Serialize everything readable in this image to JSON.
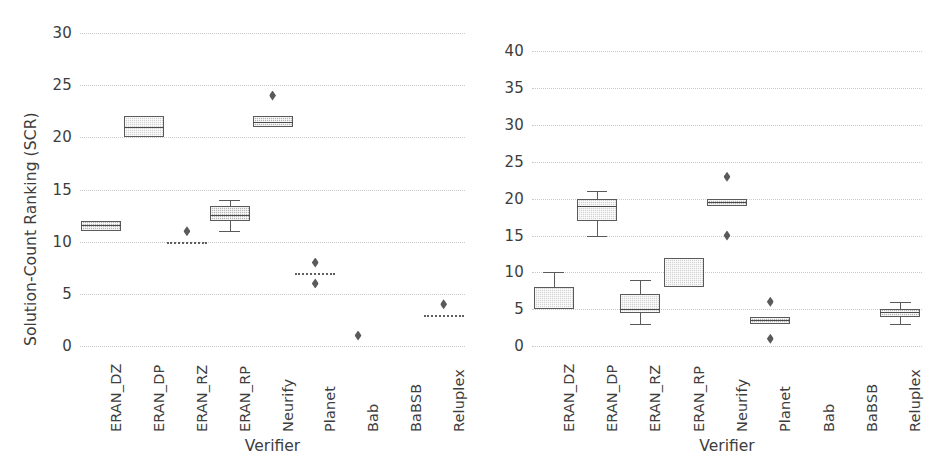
{
  "figure": {
    "width": 951,
    "height": 465,
    "background": "#ffffff",
    "panel_count": 2
  },
  "chart_data": [
    {
      "type": "box",
      "panel": "left",
      "title": "",
      "xlabel": "Verifier",
      "ylabel": "Solution-Count Ranking (SCR)",
      "ylim": [
        0,
        30
      ],
      "yticks": [
        0,
        5,
        10,
        15,
        20,
        25,
        30
      ],
      "ytick_labels": [
        "0",
        "5",
        "10",
        "15",
        "20",
        "25",
        "30"
      ],
      "grid": "horizontal-dotted",
      "legend": "none",
      "categories": [
        "ERAN_DZ",
        "ERAN_DP",
        "ERAN_RZ",
        "ERAN_RP",
        "Neurify",
        "Planet",
        "Bab",
        "BaBSB",
        "Reluplex"
      ],
      "boxes": [
        {
          "category": "ERAN_DZ",
          "whisker_low": 11,
          "q1": 11,
          "median": 11.6,
          "q3": 12,
          "whisker_high": 12,
          "fliers": [],
          "degenerate": false
        },
        {
          "category": "ERAN_DP",
          "whisker_low": 20,
          "q1": 20,
          "median": 21,
          "q3": 22,
          "whisker_high": 22,
          "fliers": [],
          "degenerate": false
        },
        {
          "category": "ERAN_RZ",
          "whisker_low": 10,
          "q1": 10,
          "median": 10,
          "q3": 10,
          "whisker_high": 10,
          "fliers": [
            11
          ],
          "degenerate": true
        },
        {
          "category": "ERAN_RP",
          "whisker_low": 11,
          "q1": 12,
          "median": 12.6,
          "q3": 13.4,
          "whisker_high": 14,
          "fliers": [],
          "degenerate": false
        },
        {
          "category": "Neurify",
          "whisker_low": 21,
          "q1": 21,
          "median": 21.5,
          "q3": 22,
          "whisker_high": 22,
          "fliers": [
            24
          ],
          "degenerate": false
        },
        {
          "category": "Planet",
          "whisker_low": 7,
          "q1": 7,
          "median": 7,
          "q3": 7,
          "whisker_high": 7,
          "fliers": [
            8,
            6
          ],
          "degenerate": true
        },
        {
          "category": "Bab",
          "whisker_low": 1,
          "q1": 1,
          "median": 1,
          "q3": 1,
          "whisker_high": 1,
          "fliers": [
            1
          ],
          "degenerate": true,
          "point_only": true
        },
        {
          "category": "BaBSB",
          "whisker_low": null,
          "q1": null,
          "median": null,
          "q3": null,
          "whisker_high": null,
          "fliers": [],
          "degenerate": false,
          "empty": true
        },
        {
          "category": "Reluplex",
          "whisker_low": 3,
          "q1": 3,
          "median": 3,
          "q3": 3,
          "whisker_high": 3,
          "fliers": [
            4
          ],
          "degenerate": true
        }
      ]
    },
    {
      "type": "box",
      "panel": "right",
      "title": "",
      "xlabel": "Verifier",
      "ylabel": "",
      "ylim": [
        0,
        44
      ],
      "yticks": [
        0,
        5,
        10,
        15,
        20,
        25,
        30,
        35,
        40
      ],
      "ytick_labels": [
        "0",
        "5",
        "10",
        "15",
        "20",
        "25",
        "30",
        "35",
        "40"
      ],
      "grid": "horizontal-dotted",
      "legend": "none",
      "categories": [
        "ERAN_DZ",
        "ERAN_DP",
        "ERAN_RZ",
        "ERAN_RP",
        "Neurify",
        "Planet",
        "Bab",
        "BaBSB",
        "Reluplex"
      ],
      "boxes": [
        {
          "category": "ERAN_DZ",
          "whisker_low": 5,
          "q1": 5,
          "median": 5,
          "q3": 8,
          "whisker_high": 10,
          "fliers": [],
          "degenerate": false
        },
        {
          "category": "ERAN_DP",
          "whisker_low": 15,
          "q1": 17,
          "median": 19,
          "q3": 20,
          "whisker_high": 21,
          "fliers": [],
          "degenerate": false
        },
        {
          "category": "ERAN_RZ",
          "whisker_low": 3,
          "q1": 4.5,
          "median": 5,
          "q3": 7,
          "whisker_high": 9,
          "fliers": [],
          "degenerate": false
        },
        {
          "category": "ERAN_RP",
          "whisker_low": 8,
          "q1": 8,
          "median": 8,
          "q3": 12,
          "whisker_high": 12,
          "fliers": [],
          "degenerate": false
        },
        {
          "category": "Neurify",
          "whisker_low": 19,
          "q1": 19,
          "median": 19.5,
          "q3": 20,
          "whisker_high": 20,
          "fliers": [
            23,
            15
          ],
          "degenerate": false
        },
        {
          "category": "Planet",
          "whisker_low": 3,
          "q1": 3,
          "median": 3.5,
          "q3": 4,
          "whisker_high": 4,
          "fliers": [
            6,
            1
          ],
          "degenerate": false
        },
        {
          "category": "Bab",
          "whisker_low": null,
          "q1": null,
          "median": null,
          "q3": null,
          "whisker_high": null,
          "fliers": [],
          "degenerate": false,
          "empty": true
        },
        {
          "category": "BaBSB",
          "whisker_low": null,
          "q1": null,
          "median": null,
          "q3": null,
          "whisker_high": null,
          "fliers": [],
          "degenerate": false,
          "empty": true
        },
        {
          "category": "Reluplex",
          "whisker_low": 3,
          "q1": 4,
          "median": 4.6,
          "q3": 5,
          "whisker_high": 6,
          "fliers": [],
          "degenerate": false
        }
      ]
    }
  ],
  "left_panel": {
    "ylabel": "Solution-Count Ranking (SCR)",
    "xlabel": "Verifier",
    "ytick_labels": [
      "30",
      "25",
      "20",
      "15",
      "10",
      "5",
      "0"
    ],
    "xtick_labels": [
      "ERAN_DZ",
      "ERAN_DP",
      "ERAN_RZ",
      "ERAN_RP",
      "Neurify",
      "Planet",
      "Bab",
      "BaBSB",
      "Reluplex"
    ]
  },
  "right_panel": {
    "ylabel": "",
    "xlabel": "Verifier",
    "ytick_labels": [
      "40",
      "35",
      "30",
      "25",
      "20",
      "15",
      "10",
      "5",
      "0"
    ],
    "xtick_labels": [
      "ERAN_DZ",
      "ERAN_DP",
      "ERAN_RZ",
      "ERAN_RP",
      "Neurify",
      "Planet",
      "Bab",
      "BaBSB",
      "Reluplex"
    ]
  },
  "style": {
    "box_fill": "#b4b4b4",
    "box_fill_light": "#d2d2d2",
    "line_color": "#5a5a5a",
    "grid_color": "#c9c9c9",
    "text_color": "#3d3d3d"
  }
}
